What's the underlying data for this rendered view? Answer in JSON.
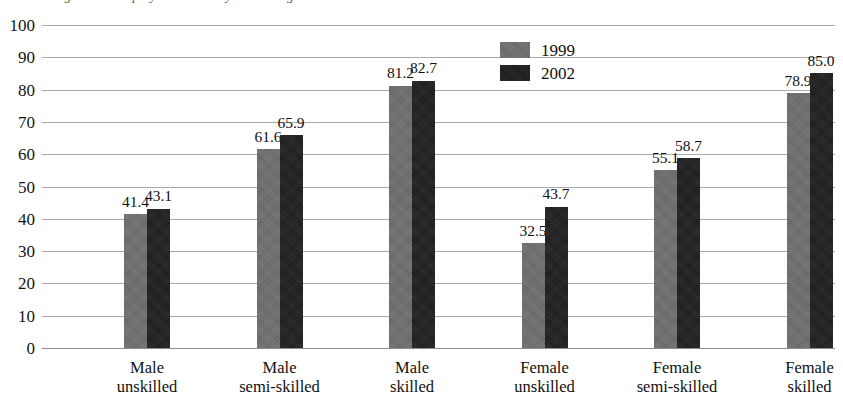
{
  "figure": {
    "caption_sliver": "Figure 3.2  Employment rates by skill and gender"
  },
  "chart_data": {
    "type": "bar",
    "title": "",
    "subtitle": "",
    "xlabel": "",
    "ylabel": "",
    "ylim": [
      0,
      100
    ],
    "ytick_step": 10,
    "yticks": [
      "100",
      "90",
      "80",
      "70",
      "60",
      "50",
      "40",
      "30",
      "20",
      "10",
      "0"
    ],
    "grid": true,
    "legend_position": "inside-top-center",
    "categories": [
      "Male\nunskilled",
      "Male\nsemi-skilled",
      "Male\nskilled",
      "Female\nunskilled",
      "Female\nsemi-skilled",
      "Female\nskilled"
    ],
    "category_lines": [
      [
        "Male",
        "unskilled"
      ],
      [
        "Male",
        "semi-skilled"
      ],
      [
        "Male",
        "skilled"
      ],
      [
        "Female",
        "unskilled"
      ],
      [
        "Female",
        "semi-skilled"
      ],
      [
        "Female",
        "skilled"
      ]
    ],
    "series": [
      {
        "name": "1999",
        "color": "#6e6e6e",
        "values": [
          41.4,
          61.6,
          81.2,
          32.5,
          55.1,
          78.9
        ],
        "labels": [
          "41.4",
          "61.6",
          "81.2",
          "32.5",
          "55.1",
          "78.9"
        ]
      },
      {
        "name": "2002",
        "color": "#1e1e1e",
        "values": [
          43.1,
          65.9,
          82.7,
          43.7,
          58.7,
          85.0
        ],
        "labels": [
          "43.1",
          "65.9",
          "82.7",
          "43.7",
          "58.7",
          "85.0"
        ]
      }
    ]
  },
  "legend": {
    "items": [
      {
        "label": "1999",
        "color": "#6e6e6e"
      },
      {
        "label": "2002",
        "color": "#1e1e1e"
      }
    ]
  }
}
